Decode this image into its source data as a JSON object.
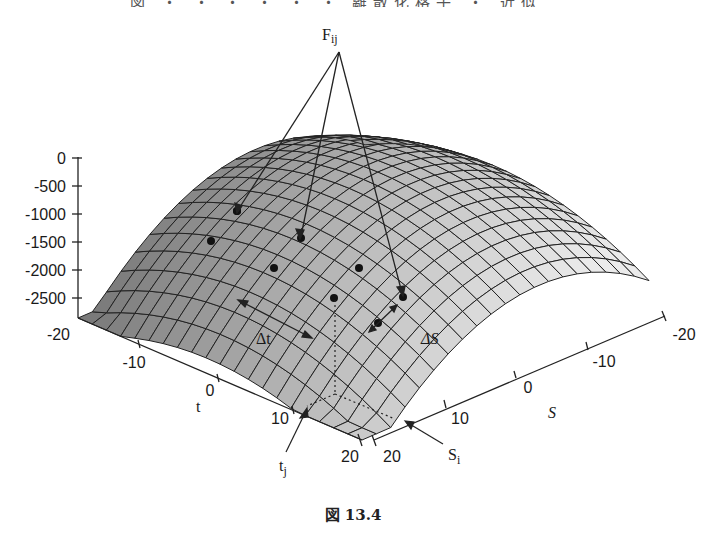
{
  "header": {
    "text": "図 ・ ・ ・ ・ ・ ・ 離散化格子 ・ 近似"
  },
  "caption": {
    "text": "図 13.4"
  },
  "labels": {
    "F": "F",
    "F_sub": "ij",
    "delta_t": "Δt",
    "delta_S": "ΔS",
    "t_axis": "t",
    "S_axis": "S",
    "t_j": "t",
    "t_j_sub": "j",
    "S_i": "S",
    "S_i_sub": "i"
  },
  "axes": {
    "z": {
      "ticks": [
        "0",
        "-500",
        "-1000",
        "-1500",
        "-2000",
        "-2500"
      ]
    },
    "t": {
      "ticks": [
        "-20",
        "-10",
        "0",
        "10",
        "20"
      ]
    },
    "S": {
      "ticks": [
        "20",
        "10",
        "0",
        "-10",
        "-20"
      ]
    }
  },
  "chart_data": {
    "type": "surface",
    "title": "",
    "caption": "図 13.4",
    "xlabel": "t",
    "ylabel": "S",
    "zlabel": "",
    "x_range": [
      -20,
      20
    ],
    "y_range": [
      -20,
      20
    ],
    "z_range": [
      -2800,
      0
    ],
    "z_ticks": [
      0,
      -500,
      -1000,
      -1500,
      -2000,
      -2500
    ],
    "x_ticks": [
      -20,
      -10,
      0,
      10,
      20
    ],
    "y_ticks": [
      -20,
      -10,
      0,
      10,
      20
    ],
    "grid": "mesh ~20x20 cells",
    "annotations": [
      "F_ij (three arrows to grid nodes)",
      "Δt",
      "ΔS",
      "t_j",
      "S_i"
    ],
    "marked_nodes": 9
  }
}
